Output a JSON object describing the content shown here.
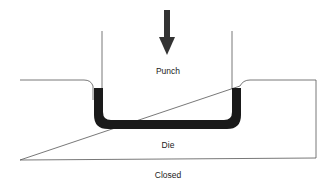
{
  "diagram": {
    "type": "deep-drawing-process",
    "labels": {
      "punch": "Punch",
      "die": "Die",
      "state": "Closed"
    },
    "arrow": {
      "direction": "down",
      "meaning": "punch-motion"
    },
    "colors": {
      "outline": "#555555",
      "blank": "#1a1a1a",
      "arrow": "#333333",
      "text": "#222222"
    }
  }
}
